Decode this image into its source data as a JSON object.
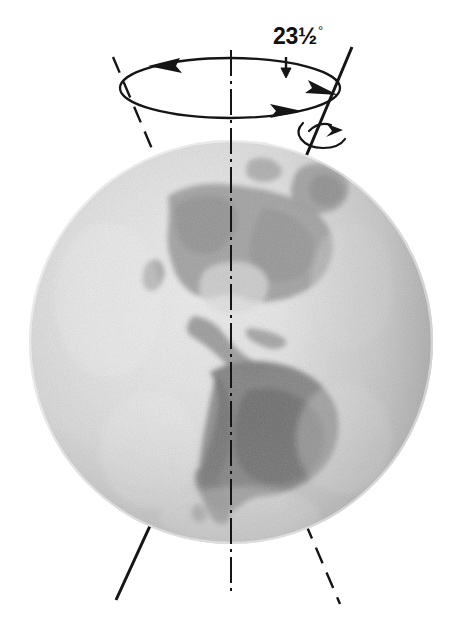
{
  "figure": {
    "background_color": "#ffffff",
    "ink_color": "#111111"
  },
  "labels": {
    "tilt_angle": {
      "whole": "23",
      "fraction": "½",
      "degree_symbol": "°",
      "full_text": "23½°",
      "x": 285,
      "y": 28
    }
  },
  "globe": {
    "name": "earth-globe",
    "center_x": 231,
    "center_y": 342,
    "radius": 202,
    "base_light": "#e3e3e3",
    "base_mid": "#cfcfcf",
    "base_shadow": "#b4b4b4",
    "land_tone": "#9a9a9a",
    "land_dark_tone": "#7d7d7d",
    "landmasses": [
      "North America",
      "Central America",
      "South America",
      "Greenland",
      "Caribbean"
    ]
  },
  "precession_ellipse": {
    "name": "precession-circle",
    "center_x": 230,
    "center_y": 88,
    "radius_x": 110,
    "radius_y": 30,
    "stroke_width": 2.2,
    "arrow_count": 3,
    "direction": "counterclockwise-viewed-from-above"
  },
  "axes": {
    "tilted_axis": {
      "name": "earth-rotation-axis",
      "style": "solid-near-dashed-far",
      "top_x": 347,
      "top_y": 57,
      "bottom_x": 120,
      "bottom_y": 592,
      "tilt_degrees": 23.5
    },
    "vertical_reference": {
      "name": "orbital-plane-normal",
      "style": "dash-dot",
      "top_x": 231,
      "top_y": 50,
      "bottom_x": 231,
      "bottom_y": 592
    },
    "dashed_mirror": {
      "name": "axis-continuation-dashed",
      "style": "dashed",
      "top_x": 113,
      "top_y": 57,
      "bottom_x": 340,
      "bottom_y": 592
    }
  },
  "rotation_arrow": {
    "name": "spin-direction-arrow",
    "center_x": 325,
    "center_y": 130,
    "description": "small curved arrow around the axis indicating daily rotation"
  }
}
